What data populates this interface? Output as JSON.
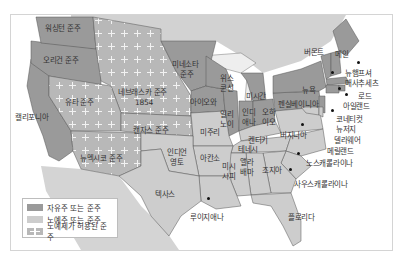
{
  "map": {
    "title": "",
    "colors": {
      "free_state": "#9a9a9a",
      "slave_state": "#cdcdcd",
      "slavery_allowed_territory": "#b8b8b8",
      "water": "#ffffff",
      "foreign_land": "#d2d2d2",
      "border": "#555555"
    },
    "labels": {
      "washington": "워싱턴 준주",
      "oregon": "오리건 준주",
      "california": "캘리포니아",
      "utah": "유타 준주",
      "nebraska": "네브래스카 준주",
      "nebraska_year": "1854",
      "minnesota_1": "미네소타",
      "minnesota_2": "준주",
      "kansas": "캔자스 준주",
      "new_mexico": "뉴멕시코 준주",
      "indian_1": "인디언",
      "indian_2": "영토",
      "texas": "텍사스",
      "iowa": "아이오와",
      "missouri": "미주리",
      "arkansas": "아칸소",
      "louisiana": "루이지애나",
      "wisconsin_1": "위스",
      "wisconsin_2": "콘신",
      "michigan": "미시간",
      "illinois_1": "일리",
      "illinois_2": "노이",
      "indiana_1": "인디",
      "indiana_2": "애나",
      "ohio_1": "오하",
      "ohio_2": "이오",
      "kentucky": "켄터키",
      "tennessee": "테네시",
      "mississippi_1": "미시",
      "mississippi_2": "시피",
      "alabama_1": "앨라",
      "alabama_2": "배마",
      "georgia": "조지아",
      "florida": "플로리다",
      "south_carolina": "사우스캐롤라이나",
      "north_carolina": "노스캐롤라이나",
      "virginia": "버지니아",
      "pennsylvania": "펜실베이니아",
      "new_york": "뉴욕",
      "vermont": "버몬트",
      "maine": "메인",
      "new_hampshire": "뉴햄프셔",
      "massachusetts": "매사추세츠",
      "rhode_island_1": "로드",
      "rhode_island_2": "아일랜드",
      "connecticut": "코네티컷",
      "new_jersey": "뉴저지",
      "delaware": "델라웨어",
      "maryland": "메릴랜드"
    },
    "legend": [
      {
        "swatch": "free",
        "label": "자유주 또는 준주"
      },
      {
        "swatch": "slave",
        "label": "노예주 또는 준주"
      },
      {
        "swatch": "allowed",
        "label": "노예제가 허용된 준주"
      }
    ]
  }
}
